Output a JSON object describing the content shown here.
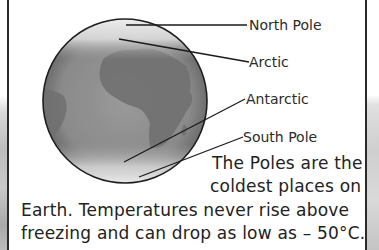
{
  "diagram": {
    "labels": [
      {
        "id": "north-pole",
        "text": "North Pole"
      },
      {
        "id": "arctic",
        "text": "Arctic"
      },
      {
        "id": "antarctic",
        "text": "Antarctic"
      },
      {
        "id": "south-pole",
        "text": "South Pole"
      }
    ]
  },
  "caption": {
    "lines": [
      "The Poles are the",
      "coldest places on",
      "Earth. Temperatures never rise above",
      "freezing and can drop as low as – 50°C."
    ]
  },
  "colors": {
    "ink": "#222222",
    "globe_fill": "#8f8f8f",
    "land": "#6f6f6f"
  }
}
